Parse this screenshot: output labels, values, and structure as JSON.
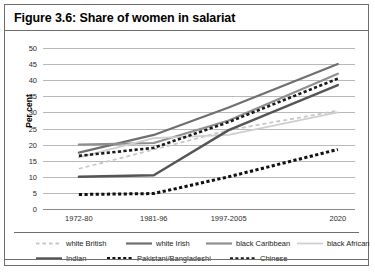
{
  "figure": {
    "title": "Figure 3.6: Share of women in salariat"
  },
  "chart_data": {
    "type": "line",
    "title": "Figure 3.6: Share of women in salariat",
    "xlabel": "",
    "ylabel": "Per cent",
    "categories": [
      "1972-80",
      "1981-96",
      "1997-2005",
      "2020"
    ],
    "ylim": [
      0,
      50
    ],
    "yticks": [
      0,
      5,
      10,
      15,
      20,
      25,
      30,
      35,
      40,
      45,
      50
    ],
    "grid": true,
    "legend_position": "bottom",
    "series": [
      {
        "name": "white British",
        "values": [
          12.5,
          18.5,
          24.5,
          30.5
        ],
        "color": "#c7c7c7",
        "style": "dashed",
        "width": 1.8
      },
      {
        "name": "white Irish",
        "values": [
          17.5,
          23.0,
          31.5,
          45.0
        ],
        "color": "#6f6f6f",
        "style": "solid",
        "width": 2.2
      },
      {
        "name": "black Caribbean",
        "values": [
          20.0,
          20.5,
          27.5,
          42.0
        ],
        "color": "#8f8f8f",
        "style": "solid",
        "width": 2.2
      },
      {
        "name": "black African",
        "values": [
          16.0,
          22.0,
          23.0,
          30.0
        ],
        "color": "#cfcfcf",
        "style": "solid",
        "width": 1.8
      },
      {
        "name": "Indian",
        "values": [
          10.0,
          10.5,
          24.5,
          38.5
        ],
        "color": "#555555",
        "style": "solid",
        "width": 2.4
      },
      {
        "name": "Pakistani/Bangladeshi",
        "values": [
          4.5,
          4.8,
          10.0,
          18.5
        ],
        "color": "#111111",
        "style": "dotted-thick",
        "width": 3.0
      },
      {
        "name": "Chinese",
        "values": [
          16.5,
          19.0,
          27.0,
          40.5
        ],
        "color": "#1a1a1a",
        "style": "dotted-thick",
        "width": 2.6
      }
    ]
  },
  "legend": {
    "rows": [
      [
        {
          "label": "white British",
          "x": 22
        },
        {
          "label": "white Irish",
          "x": 112
        },
        {
          "label": "black Caribbean",
          "x": 192
        },
        {
          "label": "black African",
          "x": 283
        }
      ],
      [
        {
          "label": "Indian",
          "x": 22
        },
        {
          "label": "Pakistani/Bangladeshi",
          "x": 93
        },
        {
          "label": "Chinese",
          "x": 216
        }
      ]
    ]
  }
}
